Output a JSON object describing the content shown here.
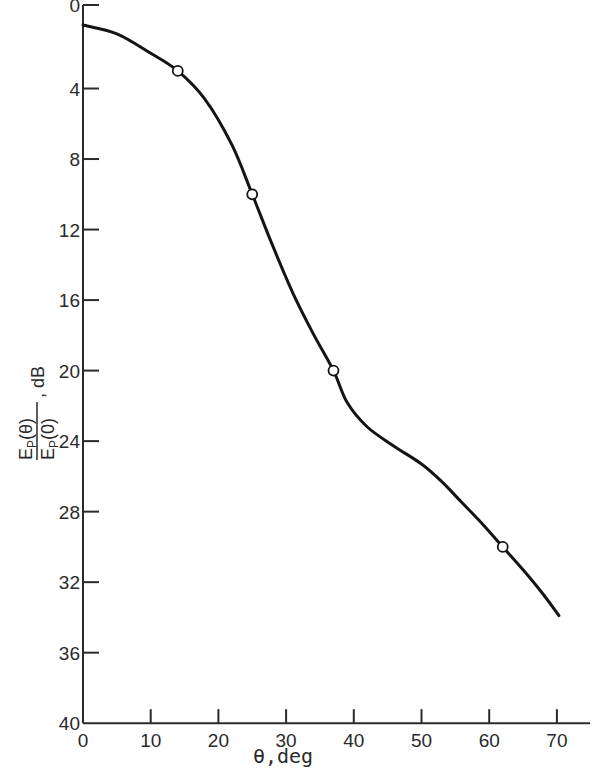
{
  "chart_data": {
    "type": "line",
    "title": "",
    "xlabel": "θ,deg",
    "ylabel": "E_P(θ)/E_P(0), dB",
    "ylabel_parts": {
      "num": "E",
      "num_sub": "P",
      "num_arg": "(θ)",
      "den": "E",
      "den_sub": "P",
      "den_arg": "(0)",
      "unit": ", dB"
    },
    "xlim": [
      0,
      75
    ],
    "ylim": [
      0,
      40
    ],
    "y_inverted": true,
    "grid": false,
    "legend": null,
    "x_ticks": [
      0,
      10,
      20,
      30,
      40,
      50,
      60,
      70
    ],
    "y_ticks": [
      0,
      4,
      8,
      12,
      16,
      20,
      24,
      28,
      32,
      36,
      40
    ],
    "series": [
      {
        "name": "measured points",
        "marker": "open-circle",
        "x": [
          14,
          25,
          37,
          62
        ],
        "y": [
          3,
          10,
          20,
          30
        ]
      },
      {
        "name": "fitted curve",
        "marker": "none",
        "x": [
          0,
          5,
          10,
          14,
          18,
          22,
          25,
          28,
          31,
          34,
          37,
          39,
          42,
          46,
          50,
          53,
          56,
          59,
          62,
          65,
          68,
          70.3
        ],
        "y": [
          0.4,
          0.9,
          2.0,
          3.0,
          4.6,
          7.2,
          10.0,
          12.9,
          15.6,
          17.9,
          20.0,
          21.8,
          23.2,
          24.3,
          25.3,
          26.3,
          27.5,
          28.7,
          30.0,
          31.3,
          32.7,
          33.9
        ]
      }
    ]
  }
}
